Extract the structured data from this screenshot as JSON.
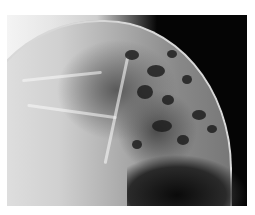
{
  "image": {
    "description": "Grayscale radiograph showing a domed lung-like structure with mottled dark nodular areas on a black background",
    "palette": {
      "background": "#050505",
      "bright": "#e8e8e8",
      "mid": "#8a8a8a",
      "dark": "#1e1e1e",
      "margin": "#ffffff"
    }
  }
}
